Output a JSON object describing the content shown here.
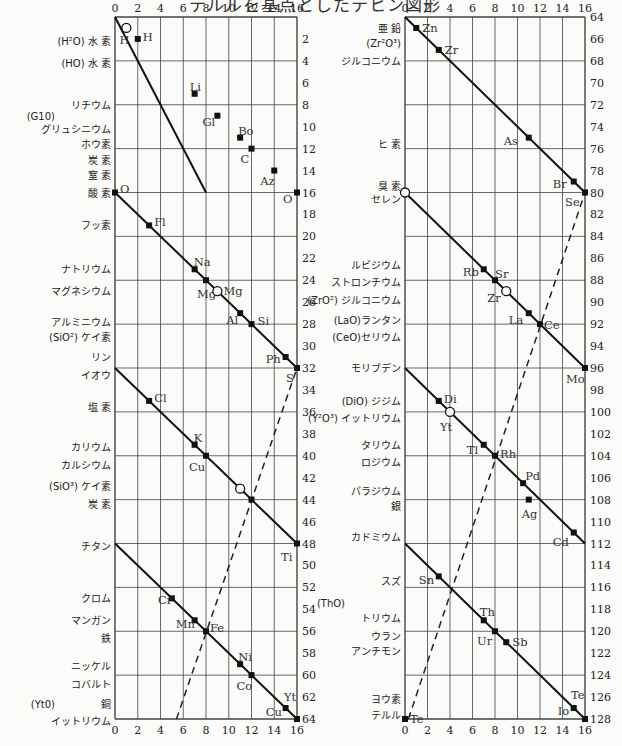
{
  "title": "テルルを基点としたテヒン図形",
  "chart_data": {
    "type": "line",
    "title": "テルルを基点としたテヒン図形",
    "xlabel": "",
    "ylabel": "",
    "grid": true,
    "panels": [
      {
        "name": "left",
        "x_ticks": [
          0,
          2,
          4,
          6,
          8,
          10,
          12,
          14,
          16
        ],
        "y_ticks": [
          2,
          4,
          6,
          8,
          10,
          12,
          14,
          16,
          18,
          20,
          22,
          24,
          26,
          28,
          30,
          32,
          34,
          36,
          38,
          40,
          42,
          44,
          46,
          48,
          50,
          52,
          54,
          56,
          58,
          60,
          62,
          64
        ],
        "ylim": [
          0,
          64
        ],
        "xlim": [
          0,
          16
        ],
        "row_labels": [
          {
            "y": 2.2,
            "text": "(H²O) 水 素"
          },
          {
            "y": 4.2,
            "text": "(HO) 水 素"
          },
          {
            "y": 8.0,
            "text": "リチウム"
          },
          {
            "y": 9.0,
            "text": "(G10)",
            "offset": true
          },
          {
            "y": 10.2,
            "text": "グリュシニウム"
          },
          {
            "y": 11.6,
            "text": "ホウ素"
          },
          {
            "y": 13.0,
            "text": "炭 素"
          },
          {
            "y": 14.4,
            "text": "窒 素"
          },
          {
            "y": 16.0,
            "text": "酸 素"
          },
          {
            "y": 19.0,
            "text": "フッ素"
          },
          {
            "y": 23.0,
            "text": "ナトリウム"
          },
          {
            "y": 25.0,
            "text": "マグネシウム"
          },
          {
            "y": 27.8,
            "text": "アルミニウム"
          },
          {
            "y": 29.2,
            "text": "(SiO²) ケイ素"
          },
          {
            "y": 31.0,
            "text": "リン"
          },
          {
            "y": 32.6,
            "text": "イオウ"
          },
          {
            "y": 35.6,
            "text": "塩 素"
          },
          {
            "y": 39.2,
            "text": "カリウム"
          },
          {
            "y": 40.8,
            "text": "カルシウム"
          },
          {
            "y": 42.8,
            "text": "(SiO³) ケイ素"
          },
          {
            "y": 44.4,
            "text": "炭 素"
          },
          {
            "y": 48.2,
            "text": "チタン"
          },
          {
            "y": 53.0,
            "text": "クロム"
          },
          {
            "y": 55.0,
            "text": "マンガン"
          },
          {
            "y": 56.6,
            "text": "鉄"
          },
          {
            "y": 59.2,
            "text": "ニッケル"
          },
          {
            "y": 60.8,
            "text": "コバルト"
          },
          {
            "y": 62.6,
            "text": "銅"
          },
          {
            "y": 62.6,
            "text": "(Yt0)",
            "offset": true
          },
          {
            "y": 64.2,
            "text": "イットリウム"
          }
        ],
        "segments": [
          {
            "from": [
              0,
              0
            ],
            "to": [
              8,
              16
            ]
          },
          {
            "from": [
              0,
              16
            ],
            "to": [
              16,
              32
            ]
          },
          {
            "from": [
              0,
              32
            ],
            "to": [
              16,
              48
            ]
          },
          {
            "from": [
              0,
              48
            ],
            "to": [
              16,
              64
            ]
          }
        ],
        "points": [
          {
            "label": "H",
            "x": 1,
            "y": 1,
            "open": true,
            "lx": -7,
            "ly": 12
          },
          {
            "label": "H",
            "x": 2,
            "y": 2,
            "open": false,
            "lx": 5,
            "ly": -2
          },
          {
            "label": "Li",
            "x": 7,
            "y": 7,
            "open": false,
            "lx": -5,
            "ly": -7
          },
          {
            "label": "Gl",
            "x": 9,
            "y": 9,
            "open": false,
            "lx": -15,
            "ly": 6
          },
          {
            "label": "Bo",
            "x": 11,
            "y": 11,
            "open": false,
            "lx": -2,
            "ly": -7
          },
          {
            "label": "C",
            "x": 12,
            "y": 12,
            "open": false,
            "lx": -11,
            "ly": 10
          },
          {
            "label": "Az",
            "x": 14,
            "y": 14,
            "open": false,
            "lx": -14,
            "ly": 10
          },
          {
            "label": "O",
            "x": 16,
            "y": 16,
            "open": false,
            "lx": -14,
            "ly": 6
          },
          {
            "label": "O",
            "x": 0,
            "y": 16,
            "open": false,
            "lx": 5,
            "ly": -4
          },
          {
            "label": "Fl",
            "x": 3,
            "y": 19,
            "open": false,
            "lx": 5,
            "ly": -3
          },
          {
            "label": "Na",
            "x": 7,
            "y": 23,
            "open": false,
            "lx": -1,
            "ly": -7
          },
          {
            "label": "Mg",
            "x": 8,
            "y": 24,
            "open": false,
            "lx": -9,
            "ly": 14
          },
          {
            "label": "Mg",
            "x": 9,
            "y": 25,
            "open": true,
            "lx": 6,
            "ly": 0
          },
          {
            "label": "Al",
            "x": 11,
            "y": 27,
            "open": false,
            "lx": -14,
            "ly": 7
          },
          {
            "label": "Si",
            "x": 12,
            "y": 28,
            "open": false,
            "lx": 6,
            "ly": -3
          },
          {
            "label": "Ph",
            "x": 15,
            "y": 31,
            "open": false,
            "lx": -20,
            "ly": 2
          },
          {
            "label": "S",
            "x": 16,
            "y": 32,
            "open": false,
            "lx": -11,
            "ly": 10
          },
          {
            "label": "Cl",
            "x": 3,
            "y": 35,
            "open": false,
            "lx": 5,
            "ly": -3
          },
          {
            "label": "K",
            "x": 7,
            "y": 39,
            "open": false,
            "lx": -1,
            "ly": -7
          },
          {
            "label": "Cu",
            "x": 8,
            "y": 40,
            "open": false,
            "lx": -17,
            "ly": 11
          },
          {
            "label": "",
            "x": 11,
            "y": 43,
            "open": true,
            "lx": 0,
            "ly": 0
          },
          {
            "label": "",
            "x": 12,
            "y": 44,
            "open": false,
            "lx": 0,
            "ly": 0
          },
          {
            "label": "Ti",
            "x": 16,
            "y": 48,
            "open": false,
            "lx": -16,
            "ly": 13
          },
          {
            "label": "Cr",
            "x": 5,
            "y": 53,
            "open": false,
            "lx": -14,
            "ly": 2
          },
          {
            "label": "Mn",
            "x": 7,
            "y": 55,
            "open": false,
            "lx": -19,
            "ly": 4
          },
          {
            "label": "Fe",
            "x": 8,
            "y": 56,
            "open": false,
            "lx": 4,
            "ly": -3
          },
          {
            "label": "Ni",
            "x": 11,
            "y": 59,
            "open": false,
            "lx": -2,
            "ly": -7
          },
          {
            "label": "Co",
            "x": 12,
            "y": 60,
            "open": false,
            "lx": -15,
            "ly": 11
          },
          {
            "label": "Cu",
            "x": 15,
            "y": 63,
            "open": false,
            "lx": -20,
            "ly": 4
          },
          {
            "label": "Yt",
            "x": 16,
            "y": 64,
            "open": false,
            "lx": -13,
            "ly": -22
          }
        ],
        "dashed": {
          "from": [
            5.4,
            64
          ],
          "to": [
            16,
            32
          ]
        }
      },
      {
        "name": "right",
        "x_ticks": [
          0,
          2,
          4,
          6,
          8,
          10,
          12,
          14,
          16
        ],
        "y_ticks": [
          64,
          66,
          68,
          70,
          72,
          74,
          76,
          78,
          80,
          82,
          84,
          86,
          88,
          90,
          92,
          94,
          96,
          98,
          100,
          102,
          104,
          106,
          108,
          110,
          112,
          114,
          116,
          118,
          120,
          122,
          124,
          126,
          128
        ],
        "ylim": [
          64,
          128
        ],
        "xlim": [
          0,
          16
        ],
        "row_labels": [
          {
            "y": 65.0,
            "text": "亜 鉛"
          },
          {
            "y": 66.4,
            "text": "(Zr²O³)"
          },
          {
            "y": 68.0,
            "text": "ジルコニウム"
          },
          {
            "y": 75.6,
            "text": "ヒ 素"
          },
          {
            "y": 79.4,
            "text": "臭 素"
          },
          {
            "y": 80.6,
            "text": "セレン"
          },
          {
            "y": 86.6,
            "text": "ルビジウム"
          },
          {
            "y": 88.2,
            "text": "ストロンチウム"
          },
          {
            "y": 89.8,
            "text": "(ZrO²) ジルコニウム"
          },
          {
            "y": 91.6,
            "text": "(LaO)ランタン"
          },
          {
            "y": 93.2,
            "text": "(CeO)セリウム"
          },
          {
            "y": 96.0,
            "text": "モリブデン"
          },
          {
            "y": 99.0,
            "text": "(DiO) ジジム"
          },
          {
            "y": 100.6,
            "text": "(Y²O³) イットリウム"
          },
          {
            "y": 103.0,
            "text": "タリウム"
          },
          {
            "y": 104.6,
            "text": "ロジウム"
          },
          {
            "y": 107.2,
            "text": "パラジウム"
          },
          {
            "y": 108.6,
            "text": "銀"
          },
          {
            "y": 111.4,
            "text": "カドミウム"
          },
          {
            "y": 115.4,
            "text": "スズ"
          },
          {
            "y": 117.4,
            "text": "(ThO)",
            "offset": true
          },
          {
            "y": 118.8,
            "text": "トリウム"
          },
          {
            "y": 120.4,
            "text": "ウラン"
          },
          {
            "y": 121.8,
            "text": "アンチモン"
          },
          {
            "y": 126.2,
            "text": "ヨウ素"
          },
          {
            "y": 127.6,
            "text": "テルル"
          }
        ],
        "segments": [
          {
            "from": [
              0,
              64
            ],
            "to": [
              16,
              80
            ]
          },
          {
            "from": [
              0,
              80
            ],
            "to": [
              16,
              96
            ]
          },
          {
            "from": [
              0,
              96
            ],
            "to": [
              16,
              112
            ]
          },
          {
            "from": [
              0,
              112
            ],
            "to": [
              16,
              128
            ]
          }
        ],
        "points": [
          {
            "label": "Zn",
            "x": 1,
            "y": 65,
            "open": false,
            "lx": 6,
            "ly": 0
          },
          {
            "label": "Zr",
            "x": 3,
            "y": 67,
            "open": false,
            "lx": 6,
            "ly": 0
          },
          {
            "label": "As",
            "x": 11,
            "y": 75,
            "open": false,
            "lx": -25,
            "ly": 3
          },
          {
            "label": "Br",
            "x": 15,
            "y": 79,
            "open": false,
            "lx": -21,
            "ly": 2
          },
          {
            "label": "Se",
            "x": 16,
            "y": 80,
            "open": false,
            "lx": -20,
            "ly": 9
          },
          {
            "label": "",
            "x": 0,
            "y": 80,
            "open": true,
            "lx": 0,
            "ly": 0
          },
          {
            "label": "Rb",
            "x": 7,
            "y": 87,
            "open": false,
            "lx": -21,
            "ly": 3
          },
          {
            "label": "Sr",
            "x": 8,
            "y": 88,
            "open": false,
            "lx": 0,
            "ly": -6
          },
          {
            "label": "Zr",
            "x": 9,
            "y": 89,
            "open": true,
            "lx": -19,
            "ly": 7
          },
          {
            "label": "La",
            "x": 11,
            "y": 91,
            "open": false,
            "lx": -20,
            "ly": 7
          },
          {
            "label": "Ce",
            "x": 12,
            "y": 92,
            "open": false,
            "lx": 4,
            "ly": 1
          },
          {
            "label": "Mo",
            "x": 16,
            "y": 96,
            "open": false,
            "lx": -19,
            "ly": 11
          },
          {
            "label": "Di",
            "x": 3,
            "y": 99,
            "open": false,
            "lx": 5,
            "ly": -2
          },
          {
            "label": "Yt",
            "x": 4,
            "y": 100,
            "open": true,
            "lx": -10,
            "ly": 15
          },
          {
            "label": "Tl",
            "x": 7,
            "y": 103,
            "open": false,
            "lx": -17,
            "ly": 5
          },
          {
            "label": "Rh",
            "x": 8,
            "y": 104,
            "open": false,
            "lx": 5,
            "ly": -2
          },
          {
            "label": "Pd",
            "x": 10.5,
            "y": 106.5,
            "open": false,
            "lx": 2,
            "ly": -7
          },
          {
            "label": "Ag",
            "x": 11,
            "y": 108,
            "open": false,
            "lx": -7,
            "ly": 14
          },
          {
            "label": "Cd",
            "x": 15,
            "y": 111,
            "open": false,
            "lx": -21,
            "ly": 9
          },
          {
            "label": "Sn",
            "x": 3,
            "y": 115,
            "open": false,
            "lx": -20,
            "ly": 4
          },
          {
            "label": "Th",
            "x": 7,
            "y": 119,
            "open": false,
            "lx": -4,
            "ly": -8
          },
          {
            "label": "Ur",
            "x": 8,
            "y": 120,
            "open": false,
            "lx": -18,
            "ly": 10
          },
          {
            "label": "Sb",
            "x": 9,
            "y": 121,
            "open": false,
            "lx": 6,
            "ly": 0
          },
          {
            "label": "Io",
            "x": 15,
            "y": 127,
            "open": false,
            "lx": -16,
            "ly": 3
          },
          {
            "label": "Te",
            "x": 16,
            "y": 128,
            "open": false,
            "lx": -14,
            "ly": -24
          },
          {
            "label": "Te",
            "x": 0,
            "y": 128,
            "open": false,
            "lx": 5,
            "ly": 0
          }
        ],
        "dashed": {
          "from": [
            0.3,
            128
          ],
          "to": [
            16,
            80
          ]
        }
      }
    ]
  }
}
